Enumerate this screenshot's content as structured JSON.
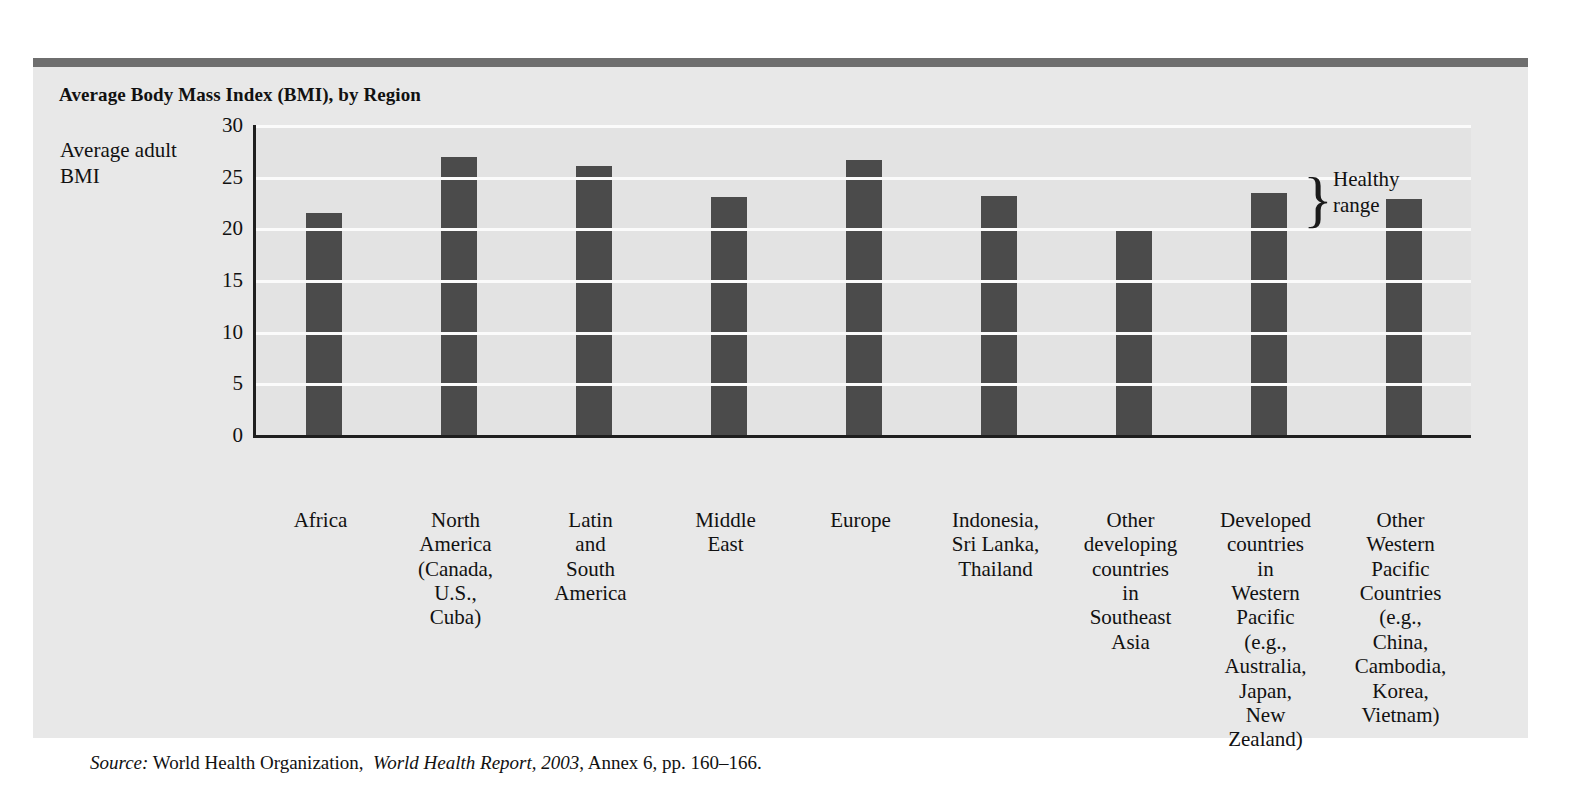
{
  "page": {
    "cutoff_headline": ""
  },
  "panel": {
    "title": "Average Body Mass Index (BMI), by Region",
    "bar_color": "#4b4b4b",
    "panel_background": "#e8e8e8",
    "plot_background": "#e3e3e3",
    "topbar_color": "#6e6e6e"
  },
  "annotation": {
    "brace_glyph": "}",
    "healthy_line1": "Healthy",
    "healthy_line2": "range"
  },
  "source": {
    "label": "Source:",
    "org": "World Health Organization,",
    "report": "World Health Report, 2003",
    "rest": ", Annex 6, pp. 160–166."
  },
  "chart_data": {
    "type": "bar",
    "title": "Average Body Mass Index (BMI), by Region",
    "xlabel": "",
    "ylabel": "Average adult BMI",
    "ylim": [
      0,
      30
    ],
    "yticks": [
      0,
      5,
      10,
      15,
      20,
      25,
      30
    ],
    "ytick_labels": [
      "0",
      "5",
      "10",
      "15",
      "20",
      "25",
      "30"
    ],
    "grid": true,
    "legend": "none",
    "annotations": [
      {
        "text": "Healthy range",
        "type": "brace",
        "y_from": 20,
        "y_to": 25,
        "position": "right-of-axis"
      }
    ],
    "categories": [
      "Africa",
      "North America (Canada, U.S., Cuba)",
      "Latin and South America",
      "Middle East",
      "Europe",
      "Indonesia, Sri Lanka, Thailand",
      "Other developing countries in Southeast Asia",
      "Developed countries in Western Pacific (e.g., Australia, Japan, New Zealand)",
      "Other Western Pacific Countries (e.g., China, Cambodia, Korea, Vietnam)"
    ],
    "category_lines": [
      [
        "Africa"
      ],
      [
        "North",
        "America",
        "(Canada,",
        "U.S.,",
        "Cuba)"
      ],
      [
        "Latin",
        "and",
        "South",
        "America"
      ],
      [
        "Middle",
        "East"
      ],
      [
        "Europe"
      ],
      [
        "Indonesia,",
        "Sri Lanka,",
        "Thailand"
      ],
      [
        "Other",
        "developing",
        "countries",
        "in",
        "Southeast",
        "Asia"
      ],
      [
        "Developed",
        "countries",
        "in",
        "Western",
        "Pacific",
        "(e.g.,",
        "Australia,",
        "Japan,",
        "New",
        "Zealand)"
      ],
      [
        "Other",
        "Western",
        "Pacific",
        "Countries",
        "(e.g.,",
        "China,",
        "Cambodia,",
        "Korea,",
        "Vietnam)"
      ]
    ],
    "values": [
      21.5,
      26.9,
      26.0,
      23.0,
      26.6,
      23.1,
      20.0,
      23.4,
      22.8
    ]
  }
}
